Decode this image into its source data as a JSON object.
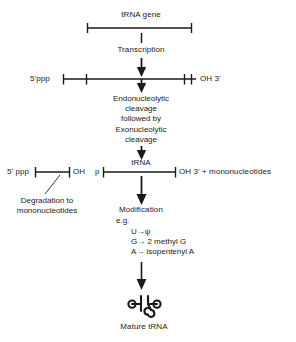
{
  "diagram": {
    "stroke_color": "#1a1a1a",
    "background_color": "#ffffff"
  },
  "nodes": {
    "gene_label": "tRNA gene",
    "transcription_label": "Transcription",
    "precursor_five_prime": "5'ppp",
    "precursor_three_prime": "OH 3'",
    "cleavage_line1": "Endonucleolytic",
    "cleavage_line2": "cleavage",
    "cleavage_line3": "followed by",
    "cleavage_line4": "Exonucleolytic",
    "cleavage_line5": "cleavage",
    "trna_label": "tRNA",
    "fragment_five_prime": "5' ppp",
    "fragment_oh": "OH",
    "trna_p_label": "p",
    "trna_three_prime": "OH 3' + mononucleotides",
    "degradation_line1": "Degradation to",
    "degradation_line2": "mononucleotides",
    "modification_label": "Modification",
    "eg_label": "e.g.",
    "mod_1": "U→ψ",
    "mod_2": "G→ 2 methyl G",
    "mod_3": "A→ isopentenyl A",
    "mature_label": "Mature tRNA"
  }
}
